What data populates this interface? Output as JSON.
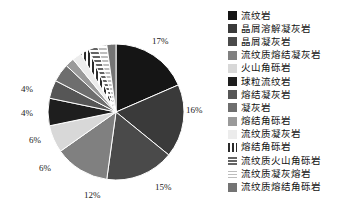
{
  "chart_data": {
    "type": "pie",
    "title": "",
    "legend_position": "right",
    "categories": [
      "流纹岩",
      "晶屑溶解凝灰岩",
      "晶屑凝灰岩",
      "流纹质熔结凝灰岩",
      "火山角砾岩",
      "球粒流纹岩",
      "熔结凝灰岩",
      "凝灰岩",
      "熔结角砾岩",
      "流纹质凝灰岩",
      "熔结角砾岩",
      "流纹质火山角砾岩",
      "流纹质凝灰熔岩",
      "流纹质熔结角砾岩"
    ],
    "values": [
      17,
      16,
      15,
      12,
      6,
      6,
      4,
      4,
      2,
      2,
      2,
      2,
      2,
      2
    ],
    "value_unit": "%",
    "labeled_values": [
      "17%",
      "16%",
      "15%",
      "12%",
      "6%",
      "6%",
      "4%",
      "4%"
    ],
    "colors": [
      "#151515",
      "#3a3a3a",
      "#4a4a4a",
      "#808080",
      "#d8d8d8",
      "#1e1e1e",
      "#565656",
      "#6e6e6e",
      "#9a9a9a",
      "#ececec",
      "#2b2b2b",
      "#646464",
      "#bdbdbd",
      "#747474"
    ],
    "patterns": [
      "solid",
      "solid",
      "solid",
      "solid",
      "solid",
      "solid",
      "solid",
      "solid",
      "solid",
      "solid",
      "vstripe",
      "hstripe",
      "hstripe",
      "solid"
    ]
  },
  "pie_labels": [
    {
      "text": "17%",
      "x": 152,
      "y": 36
    },
    {
      "text": "16%",
      "x": 186,
      "y": 105
    },
    {
      "text": "15%",
      "x": 155,
      "y": 182
    },
    {
      "text": "12%",
      "x": 84,
      "y": 190
    },
    {
      "text": "6%",
      "x": 39,
      "y": 163
    },
    {
      "text": "6%",
      "x": 29,
      "y": 135
    },
    {
      "text": "4%",
      "x": 21,
      "y": 108
    },
    {
      "text": "4%",
      "x": 21,
      "y": 84
    }
  ],
  "legend": {
    "items": [
      {
        "label": "流纹岩",
        "color": "#151515",
        "pattern": "solid"
      },
      {
        "label": "晶屑溶解凝灰岩",
        "color": "#3a3a3a",
        "pattern": "solid"
      },
      {
        "label": "晶屑凝灰岩",
        "color": "#4a4a4a",
        "pattern": "solid"
      },
      {
        "label": "流纹质熔结凝灰岩",
        "color": "#808080",
        "pattern": "solid"
      },
      {
        "label": "火山角砾岩",
        "color": "#d8d8d8",
        "pattern": "solid"
      },
      {
        "label": "球粒流纹岩",
        "color": "#1e1e1e",
        "pattern": "solid"
      },
      {
        "label": "熔结凝灰岩",
        "color": "#565656",
        "pattern": "solid"
      },
      {
        "label": "凝灰岩",
        "color": "#6e6e6e",
        "pattern": "solid"
      },
      {
        "label": "熔结角砾岩",
        "color": "#9a9a9a",
        "pattern": "solid"
      },
      {
        "label": "流纹质凝灰岩",
        "color": "#ececec",
        "pattern": "solid"
      },
      {
        "label": "熔结角砾岩",
        "color": "#2b2b2b",
        "pattern": "vstripe"
      },
      {
        "label": "流纹质火山角砾岩",
        "color": "#646464",
        "pattern": "hstripe"
      },
      {
        "label": "流纹质凝灰熔岩",
        "color": "#bdbdbd",
        "pattern": "hstripe"
      },
      {
        "label": "流纹质熔结角砾岩",
        "color": "#747474",
        "pattern": "solid"
      }
    ]
  },
  "geometry": {
    "cx": 116,
    "cy": 112,
    "r": 68
  }
}
